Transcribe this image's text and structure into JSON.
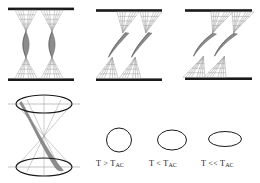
{
  "figure": {
    "name": "twisted-ribbon-temperature-diagram",
    "background_color": "#ffffff",
    "width": 260,
    "height": 183,
    "colors": {
      "plate": "#1a1a1a",
      "ribbon_fill": "#8c8c8c",
      "ribbon_stroke": "#5a5a5a",
      "thin_line": "#9a9a9a",
      "ellipse_stroke": "#1a1a1a",
      "axis_line": "#9a9a9a",
      "text": "#1a1a1a"
    }
  },
  "top_row": {
    "name": "twisted-ribbon-panels",
    "panels": [
      {
        "id": "panel-a",
        "state_label": "T > T_AC",
        "tilt_degrees": 0,
        "description": "two nearly vertical twisted ribbons between parallel plates",
        "plate_top_y": 9,
        "plate_bottom_y": 80
      },
      {
        "id": "panel-b",
        "state_label": "T < T_AC",
        "tilt_degrees": 18,
        "description": "two tilted twisted ribbons between parallel plates",
        "plate_top_y": 11,
        "plate_bottom_y": 80
      },
      {
        "id": "panel-c",
        "state_label": "T << T_AC",
        "tilt_degrees": 30,
        "description": "two strongly tilted twisted ribbons between parallel plates",
        "plate_top_y": 11,
        "plate_bottom_y": 79
      }
    ]
  },
  "cone_figure": {
    "name": "double-cone-diagram",
    "description": "hourglass double cone with elliptical top and bottom cross sections and a shaded twisted ribbon",
    "top_ellipse": {
      "cx": 44,
      "cy": 104,
      "rx": 28,
      "ry": 9
    },
    "bottom_ellipse": {
      "cx": 44,
      "cy": 167,
      "rx": 28,
      "ry": 9
    },
    "apex": {
      "x": 44,
      "y": 136
    }
  },
  "ellipse_row": {
    "name": "director-cone-cross-sections",
    "items": [
      {
        "id": "cross-section-1",
        "label_prefix": "T",
        "label_operator": ">",
        "label_symbol": "T",
        "label_subscript": "AC",
        "label_full": "T > T_AC",
        "rx": 12.5,
        "ry": 12.0,
        "cx": 119,
        "cy": 140
      },
      {
        "id": "cross-section-2",
        "label_prefix": "T",
        "label_operator": "<",
        "label_symbol": "T",
        "label_subscript": "AC",
        "label_full": "T < T_AC",
        "rx": 14.5,
        "ry": 10.0,
        "cx": 172,
        "cy": 140
      },
      {
        "id": "cross-section-3",
        "label_prefix": "T",
        "label_operator": "<<",
        "label_symbol": "T",
        "label_subscript": "AC",
        "label_full": "T << T_AC",
        "rx": 16.5,
        "ry": 7.5,
        "cx": 225,
        "cy": 139
      }
    ]
  }
}
